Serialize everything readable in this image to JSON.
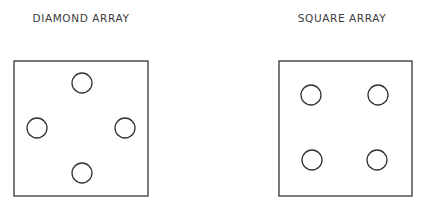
{
  "panels": [
    {
      "title": "DIAMOND ARRAY",
      "title_x": 81,
      "box": {
        "x": 14,
        "y": 61,
        "w": 134,
        "h": 135
      },
      "holes": [
        {
          "cx": 82,
          "cy": 83,
          "r": 10
        },
        {
          "cx": 37,
          "cy": 128,
          "r": 10
        },
        {
          "cx": 125,
          "cy": 128,
          "r": 10
        },
        {
          "cx": 82,
          "cy": 173,
          "r": 10
        }
      ]
    },
    {
      "title": "SQUARE ARRAY",
      "title_x": 342,
      "box": {
        "x": 279,
        "y": 61,
        "w": 133,
        "h": 135
      },
      "holes": [
        {
          "cx": 311,
          "cy": 95,
          "r": 10
        },
        {
          "cx": 378,
          "cy": 95,
          "r": 10
        },
        {
          "cx": 312,
          "cy": 160,
          "r": 10
        },
        {
          "cx": 377,
          "cy": 160,
          "r": 10
        }
      ]
    }
  ],
  "colors": {
    "stroke": "#333333",
    "text": "#3a3a3a",
    "background": "#ffffff"
  }
}
